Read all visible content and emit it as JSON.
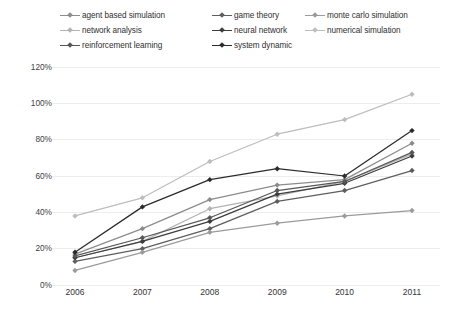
{
  "chart_data": {
    "type": "line",
    "title": "",
    "subtitle": "",
    "xlabel": "",
    "ylabel": "",
    "x": [
      "2006",
      "2007",
      "2008",
      "2009",
      "2010",
      "2011"
    ],
    "categories": [
      "2006",
      "2007",
      "2008",
      "2009",
      "2010",
      "2011"
    ],
    "ylim": [
      0,
      120
    ],
    "ytick_labels": [
      "0%",
      "20%",
      "40%",
      "60%",
      "80%",
      "100%",
      "120%"
    ],
    "ytick_values": [
      0,
      20,
      40,
      60,
      80,
      100,
      120
    ],
    "grid": "horizontal",
    "legend_position": "top",
    "legend_columns": 3,
    "value_suffix": "%",
    "series": [
      {
        "name": "agent based simulation",
        "color": "#8c8c8c",
        "marker": "diamond",
        "values": [
          17,
          31,
          47,
          55,
          58,
          78
        ]
      },
      {
        "name": "game theory",
        "color": "#5e5e5e",
        "marker": "diamond",
        "values": [
          13,
          20,
          31,
          46,
          52,
          63
        ]
      },
      {
        "name": "monte carlo simulation",
        "color": "#9b9b9b",
        "marker": "diamond",
        "values": [
          8,
          18,
          29,
          34,
          38,
          41
        ]
      },
      {
        "name": "network analysis",
        "color": "#b3b3b3",
        "marker": "diamond",
        "values": [
          15,
          24,
          42,
          49,
          57,
          72
        ]
      },
      {
        "name": "neural network",
        "color": "#3d3d3d",
        "marker": "diamond",
        "values": [
          15,
          24,
          35,
          50,
          56,
          71
        ]
      },
      {
        "name": "numerical simulation",
        "color": "#bdbdbd",
        "marker": "diamond",
        "values": [
          38,
          48,
          68,
          83,
          91,
          105
        ]
      },
      {
        "name": "reinforcement learning",
        "color": "#575757",
        "marker": "diamond",
        "values": [
          16,
          26,
          37,
          52,
          57,
          73
        ]
      },
      {
        "name": "system dynamic",
        "color": "#2b2b2b",
        "marker": "diamond",
        "values": [
          18,
          43,
          58,
          64,
          60,
          85
        ]
      }
    ]
  },
  "legend": {
    "rows": [
      [
        "agent based simulation",
        "game theory",
        "monte carlo simulation"
      ],
      [
        "network analysis",
        "neural network",
        "numerical simulation"
      ],
      [
        "reinforcement learning",
        "system dynamic"
      ]
    ]
  },
  "caption": {
    "text": ""
  },
  "colors": {
    "grid": "#ededed",
    "axis_text": "#404040",
    "background": "#ffffff"
  }
}
